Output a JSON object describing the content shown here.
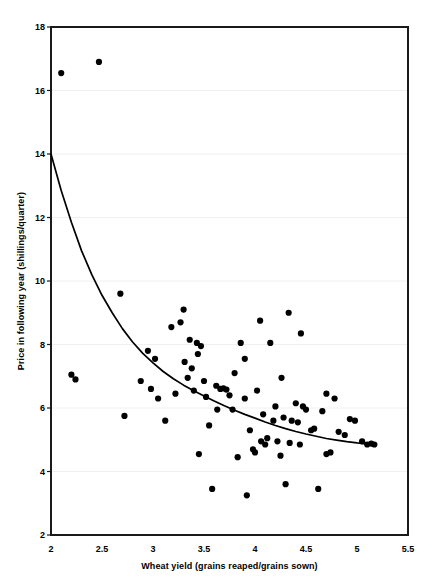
{
  "chart_data": {
    "type": "scatter",
    "title": "",
    "xlabel": "Wheat yield (grains reaped/grains sown)",
    "ylabel": "Price in following year (shillings/quarter)",
    "xlim": [
      2,
      5.5
    ],
    "ylim": [
      2,
      18
    ],
    "xticks": [
      2,
      2.5,
      3,
      3.5,
      4,
      4.5,
      5,
      5.5
    ],
    "xtick_labels": [
      "2",
      "2.5",
      "3",
      "3.5",
      "4",
      "4.5",
      "5",
      "5.5"
    ],
    "yticks": [
      2,
      4,
      6,
      8,
      10,
      12,
      14,
      16,
      18
    ],
    "ytick_labels": [
      "2",
      "4",
      "6",
      "8",
      "10",
      "12",
      "14",
      "16",
      "18"
    ],
    "grid": "horizontal-faint",
    "legend": "none",
    "marker_color": "#000000",
    "marker_size": 3.1,
    "curve_color": "#000000",
    "frame_color": "#1a1a1a",
    "grid_color": "#f0f0f0",
    "points": [
      [
        2.1,
        16.55
      ],
      [
        2.47,
        16.9
      ],
      [
        2.2,
        7.05
      ],
      [
        2.24,
        6.9
      ],
      [
        2.68,
        9.6
      ],
      [
        2.72,
        5.75
      ],
      [
        2.88,
        6.85
      ],
      [
        2.95,
        7.8
      ],
      [
        3.02,
        7.55
      ],
      [
        3.05,
        6.3
      ],
      [
        3.12,
        5.6
      ],
      [
        3.18,
        8.55
      ],
      [
        3.22,
        6.45
      ],
      [
        3.27,
        8.7
      ],
      [
        3.3,
        9.1
      ],
      [
        3.31,
        7.45
      ],
      [
        3.34,
        6.95
      ],
      [
        3.36,
        8.15
      ],
      [
        3.38,
        7.25
      ],
      [
        3.4,
        6.55
      ],
      [
        3.43,
        8.05
      ],
      [
        3.45,
        4.55
      ],
      [
        3.47,
        7.95
      ],
      [
        3.5,
        6.85
      ],
      [
        3.52,
        6.35
      ],
      [
        3.55,
        5.45
      ],
      [
        3.58,
        3.45
      ],
      [
        3.62,
        6.7
      ],
      [
        3.66,
        6.6
      ],
      [
        3.69,
        6.62
      ],
      [
        3.72,
        6.58
      ],
      [
        3.75,
        6.4
      ],
      [
        3.78,
        5.95
      ],
      [
        3.8,
        7.1
      ],
      [
        3.83,
        4.45
      ],
      [
        3.86,
        8.05
      ],
      [
        3.9,
        7.55
      ],
      [
        3.92,
        3.25
      ],
      [
        3.95,
        5.3
      ],
      [
        3.98,
        4.7
      ],
      [
        4.0,
        4.6
      ],
      [
        4.02,
        6.55
      ],
      [
        4.05,
        8.75
      ],
      [
        4.08,
        5.8
      ],
      [
        4.1,
        4.85
      ],
      [
        4.12,
        5.05
      ],
      [
        4.15,
        8.05
      ],
      [
        4.18,
        5.6
      ],
      [
        4.2,
        6.05
      ],
      [
        4.22,
        4.95
      ],
      [
        4.25,
        4.5
      ],
      [
        4.28,
        5.7
      ],
      [
        4.3,
        3.6
      ],
      [
        4.33,
        9.0
      ],
      [
        4.36,
        5.6
      ],
      [
        4.4,
        6.15
      ],
      [
        4.42,
        5.55
      ],
      [
        4.45,
        8.35
      ],
      [
        4.47,
        6.05
      ],
      [
        4.5,
        5.95
      ],
      [
        4.55,
        5.3
      ],
      [
        4.58,
        5.35
      ],
      [
        4.62,
        3.45
      ],
      [
        4.66,
        5.9
      ],
      [
        4.7,
        4.55
      ],
      [
        4.74,
        4.6
      ],
      [
        4.78,
        6.3
      ],
      [
        4.82,
        5.25
      ],
      [
        4.88,
        5.15
      ],
      [
        4.93,
        5.65
      ],
      [
        4.98,
        5.6
      ],
      [
        5.05,
        4.95
      ],
      [
        5.1,
        4.85
      ],
      [
        5.14,
        4.88
      ],
      [
        5.17,
        4.85
      ],
      [
        3.44,
        7.7
      ],
      [
        3.9,
        6.3
      ],
      [
        4.06,
        4.95
      ],
      [
        4.34,
        4.9
      ],
      [
        4.44,
        4.85
      ],
      [
        3.63,
        5.95
      ],
      [
        4.26,
        6.95
      ],
      [
        4.7,
        6.45
      ],
      [
        2.98,
        6.6
      ]
    ],
    "fit_curve": {
      "description": "decaying exponential trend line",
      "x_start": 2.0,
      "y_start": 14.0,
      "x_end": 5.17,
      "y_end": 4.85,
      "points": [
        [
          2.0,
          14.0
        ],
        [
          2.1,
          12.85
        ],
        [
          2.2,
          11.85
        ],
        [
          2.3,
          10.95
        ],
        [
          2.4,
          10.2
        ],
        [
          2.5,
          9.55
        ],
        [
          2.6,
          9.0
        ],
        [
          2.7,
          8.5
        ],
        [
          2.8,
          8.08
        ],
        [
          2.9,
          7.72
        ],
        [
          3.0,
          7.42
        ],
        [
          3.1,
          7.15
        ],
        [
          3.2,
          6.92
        ],
        [
          3.3,
          6.72
        ],
        [
          3.4,
          6.54
        ],
        [
          3.5,
          6.38
        ],
        [
          3.6,
          6.22
        ],
        [
          3.7,
          6.07
        ],
        [
          3.8,
          5.93
        ],
        [
          3.9,
          5.8
        ],
        [
          4.0,
          5.68
        ],
        [
          4.1,
          5.56
        ],
        [
          4.2,
          5.45
        ],
        [
          4.3,
          5.35
        ],
        [
          4.4,
          5.26
        ],
        [
          4.5,
          5.18
        ],
        [
          4.6,
          5.11
        ],
        [
          4.7,
          5.04
        ],
        [
          4.8,
          4.99
        ],
        [
          4.9,
          4.94
        ],
        [
          5.0,
          4.9
        ],
        [
          5.1,
          4.87
        ],
        [
          5.17,
          4.85
        ]
      ]
    }
  }
}
